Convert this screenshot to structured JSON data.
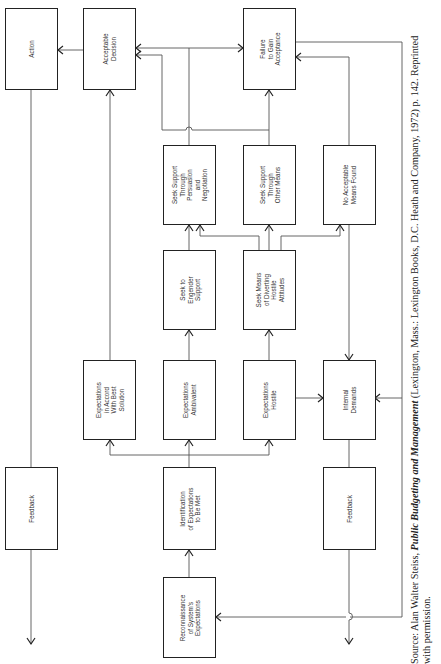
{
  "boxes": {
    "action": "Action",
    "acceptable_decision": "Acceptable\nDecision",
    "failure_to_gain_acceptance": "Failure\nto Gain\nAcceptance",
    "seek_support_persuasion": "Seek Support\nThrough\nPersuasion\nand\nNegotiation",
    "seek_support_other_means": "Seek Support\nThrough\nOther Means",
    "no_acceptable_means_found": "No Acceptable\nMeans Found",
    "seek_to_engender_support": "Seek to\nEngender\nSupport",
    "seek_means_diverting": "Seek Means\nof Diverting\nHostile\nAttitudes",
    "expectations_accord": "Expectations\nin Accord\nWith Best\nSolution",
    "expectations_ambivalent": "Expectations\nAmbivalent",
    "expectations_hostile": "Expectations\nHostile",
    "internal_demands": "Internal\nDemands",
    "feedback_left": "Feedback",
    "identification": "Identification\nof Expectations\nto Be Met",
    "feedback_right": "Feedback",
    "reconnaissance": "Reconnaissance\nof System's\nExpectations"
  },
  "source": {
    "prefix": "Source: Alan Walter Steiss, ",
    "title": "Public Budgeting and Management",
    "suffix": " (Lexington, Mass.: Lexington Books, D.C. Heath and Company, 1972) p. 142. Reprinted",
    "line2": "with permission."
  }
}
